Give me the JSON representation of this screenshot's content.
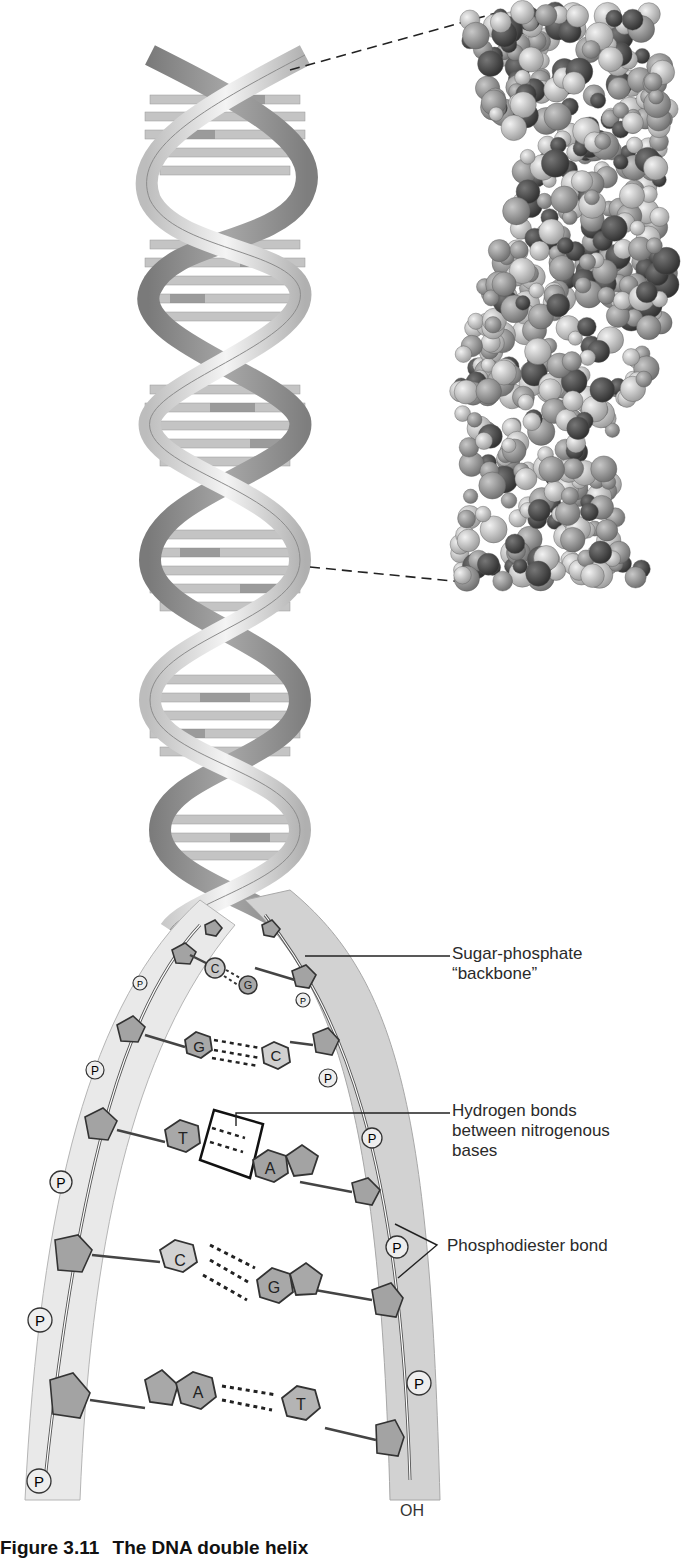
{
  "figure": {
    "caption_number": "Figure 3.11",
    "caption_title": "The DNA double helix",
    "labels": {
      "backbone_line1": "Sugar-phosphate",
      "backbone_line2": "“backbone”",
      "hbonds_line1": "Hydrogen bonds",
      "hbonds_line2": "between nitrogenous",
      "hbonds_line3": "bases",
      "phosphodiester": "Phosphodiester bond",
      "oh_terminus": "OH"
    },
    "phosphate_symbol": "P",
    "base_pairs": [
      {
        "left": "C",
        "right": "G"
      },
      {
        "left": "G",
        "right": "C"
      },
      {
        "left": "T",
        "right": "A"
      },
      {
        "left": "C",
        "right": "G"
      },
      {
        "left": "A",
        "right": "T"
      }
    ],
    "panels": {
      "ribbon_model": "double-helix-ribbon",
      "space_filling_model": "space-filling-atoms"
    }
  },
  "colors": {
    "ribbon_light": "#e6e6e6",
    "ribbon_dark": "#9a9a9a",
    "base_fill": "#a8a8a8",
    "base_light": "#d4d4d4",
    "atom_dark": "#4a4a4a",
    "atom_light": "#cfcfcf"
  }
}
